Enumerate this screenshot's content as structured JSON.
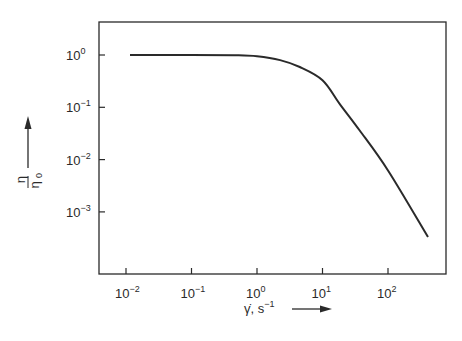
{
  "chart_data": {
    "type": "line",
    "title": "",
    "xscale": "log",
    "yscale": "log",
    "xlabel": {
      "symbol": "γ̇",
      "unit_base": ", s",
      "unit_exp": "−1"
    },
    "ylabel": {
      "numerator": "η",
      "denominator": "η",
      "denominator_sub": "0"
    },
    "xlim": [
      0.005,
      600
    ],
    "ylim": [
      5e-05,
      4
    ],
    "x_ticks": [
      {
        "value": 0.01,
        "base": "10",
        "exp": "−2"
      },
      {
        "value": 0.1,
        "base": "10",
        "exp": "−1"
      },
      {
        "value": 1,
        "base": "10",
        "exp": "0"
      },
      {
        "value": 10,
        "base": "10",
        "exp": "1"
      },
      {
        "value": 100,
        "base": "10",
        "exp": "2"
      }
    ],
    "y_ticks": [
      {
        "value": 1,
        "base": "10",
        "exp": "0"
      },
      {
        "value": 0.1,
        "base": "10",
        "exp": "−1"
      },
      {
        "value": 0.01,
        "base": "10",
        "exp": "−2"
      },
      {
        "value": 0.001,
        "base": "10",
        "exp": "−3"
      }
    ],
    "grid": false,
    "series": [
      {
        "name": "η/η0",
        "color": "#2a2a2a",
        "x": [
          0.0115,
          0.1,
          0.5,
          1.0,
          2.25,
          4.5,
          10,
          18.5,
          37,
          100,
          408
        ],
        "y": [
          1.0,
          1.0,
          0.99,
          0.95,
          0.8,
          0.59,
          0.33,
          0.114,
          0.036,
          0.0062,
          0.00033
        ]
      }
    ]
  }
}
